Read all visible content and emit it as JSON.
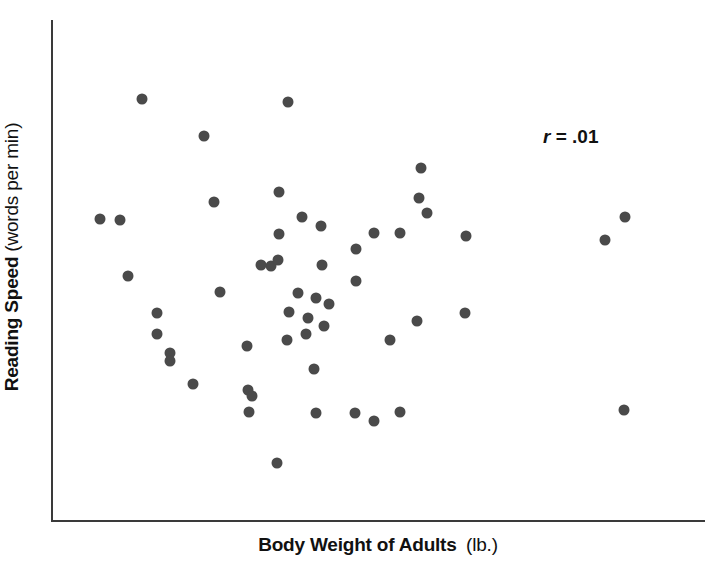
{
  "chart_data": {
    "type": "scatter",
    "title": "",
    "xlabel": "Body Weight of Adults (lb.)",
    "ylabel": "Reading Speed (words per min)",
    "xlabel_strong": "Body Weight of Adults",
    "xlabel_light": "(lb.)",
    "ylabel_strong": "Reading Speed",
    "ylabel_light": "(words per min)",
    "annotation": "r = .01",
    "annotation_symbol": "r",
    "annotation_value": "= .01",
    "correlation": 0.01,
    "grid": false,
    "legend": "none",
    "axis_ticks": "none",
    "xlim": [
      0,
      100
    ],
    "ylim": [
      0,
      100
    ],
    "marker_color": "#4a4a4a",
    "axis_color": "#3a3a3a",
    "n_points": 53,
    "points": [
      {
        "x": 13.7,
        "y": 84.2
      },
      {
        "x": 10.3,
        "y": 60.0
      },
      {
        "x": 11.5,
        "y": 48.8
      },
      {
        "x": 23.2,
        "y": 76.8
      },
      {
        "x": 24.7,
        "y": 63.6
      },
      {
        "x": 16.0,
        "y": 41.4
      },
      {
        "x": 15.9,
        "y": 37.2
      },
      {
        "x": 18.0,
        "y": 33.4
      },
      {
        "x": 17.9,
        "y": 31.8
      },
      {
        "x": 29.8,
        "y": 34.8
      },
      {
        "x": 29.9,
        "y": 26.0
      },
      {
        "x": 30.1,
        "y": 21.6
      },
      {
        "x": 33.4,
        "y": 50.8
      },
      {
        "x": 36.0,
        "y": 83.6
      },
      {
        "x": 34.7,
        "y": 65.6
      },
      {
        "x": 34.7,
        "y": 57.2
      },
      {
        "x": 34.5,
        "y": 52.0
      },
      {
        "x": 38.2,
        "y": 60.6
      },
      {
        "x": 41.1,
        "y": 58.8
      },
      {
        "x": 41.3,
        "y": 51.0
      },
      {
        "x": 37.6,
        "y": 45.4
      },
      {
        "x": 36.2,
        "y": 41.6
      },
      {
        "x": 40.3,
        "y": 44.4
      },
      {
        "x": 42.3,
        "y": 43.2
      },
      {
        "x": 39.1,
        "y": 40.4
      },
      {
        "x": 41.5,
        "y": 38.8
      },
      {
        "x": 38.8,
        "y": 37.2
      },
      {
        "x": 35.9,
        "y": 36.0
      },
      {
        "x": 40.0,
        "y": 30.2
      },
      {
        "x": 40.3,
        "y": 21.4
      },
      {
        "x": 34.4,
        "y": 11.4
      },
      {
        "x": 46.5,
        "y": 54.2
      },
      {
        "x": 46.5,
        "y": 47.8
      },
      {
        "x": 49.3,
        "y": 57.4
      },
      {
        "x": 53.2,
        "y": 57.4
      },
      {
        "x": 51.7,
        "y": 36.0
      },
      {
        "x": 46.3,
        "y": 21.4
      },
      {
        "x": 53.2,
        "y": 21.6
      },
      {
        "x": 56.4,
        "y": 70.4
      },
      {
        "x": 56.2,
        "y": 64.4
      },
      {
        "x": 57.4,
        "y": 61.4
      },
      {
        "x": 55.9,
        "y": 39.8
      },
      {
        "x": 63.2,
        "y": 41.4
      },
      {
        "x": 49.2,
        "y": 19.8
      },
      {
        "x": 63.4,
        "y": 56.8
      },
      {
        "x": 87.6,
        "y": 22.0
      },
      {
        "x": 84.6,
        "y": 56.0
      },
      {
        "x": 87.7,
        "y": 60.6
      },
      {
        "x": 21.4,
        "y": 27.2
      },
      {
        "x": 25.6,
        "y": 45.6
      },
      {
        "x": 30.5,
        "y": 24.8
      },
      {
        "x": 31.9,
        "y": 51.0
      },
      {
        "x": 7.2,
        "y": 60.2
      }
    ]
  }
}
